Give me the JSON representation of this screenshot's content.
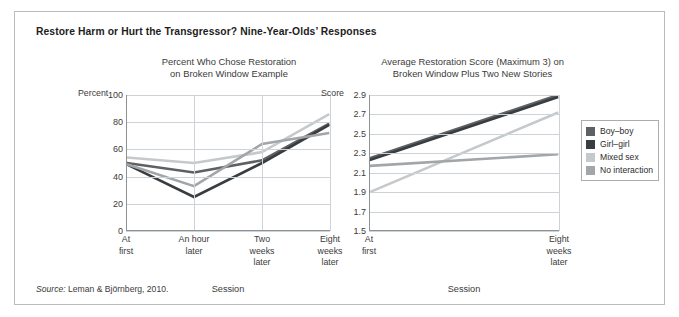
{
  "figure": {
    "title": "Restore Harm or Hurt the Transgressor? Nine-Year-Olds’ Responses",
    "source_prefix": "Source:",
    "source_text": "Leman & Björnberg, 2010.",
    "border_color": "#b9bcbe",
    "background": "#ffffff"
  },
  "legend": {
    "position": "right",
    "items": [
      {
        "label": "Boy–boy",
        "color": "#5e6164"
      },
      {
        "label": "Girl–girl",
        "color": "#3a3d40"
      },
      {
        "label": "Mixed sex",
        "color": "#c6c9cb"
      },
      {
        "label": "No interaction",
        "color": "#a2a6a9"
      }
    ]
  },
  "chart_data": [
    {
      "type": "line",
      "title": "Percent Who Chose Restoration\non Broken Window Example",
      "title_line1": "Percent Who Chose Restoration",
      "title_line2": "on Broken Window Example",
      "ylabel": "Percent",
      "xlabel": "Session",
      "ylim": [
        0,
        100
      ],
      "yticks": [
        100,
        80,
        60,
        40,
        20,
        0
      ],
      "grid": true,
      "categories": [
        "At first",
        "An hour later",
        "Two weeks later",
        "Eight weeks later"
      ],
      "category_lines": [
        [
          "At",
          "first"
        ],
        [
          "An hour",
          "later"
        ],
        [
          "Two",
          "weeks",
          "later"
        ],
        [
          "Eight",
          "weeks",
          "later"
        ]
      ],
      "series": [
        {
          "name": "Boy–boy",
          "color": "#5e6164",
          "values": [
            50,
            43,
            52,
            79
          ]
        },
        {
          "name": "Girl–girl",
          "color": "#3a3d40",
          "values": [
            49,
            25,
            50,
            78
          ]
        },
        {
          "name": "Mixed sex",
          "color": "#c6c9cb",
          "values": [
            54,
            50,
            58,
            86
          ]
        },
        {
          "name": "No interaction",
          "color": "#a2a6a9",
          "values": [
            49,
            33,
            64,
            72
          ]
        }
      ]
    },
    {
      "type": "line",
      "title": "Average Restoration Score (Maximum 3) on\nBroken Window Plus Two New Stories",
      "title_line1": "Average Restoration Score (Maximum 3) on",
      "title_line2": "Broken Window Plus Two New Stories",
      "ylabel": "Score",
      "xlabel": "Session",
      "ylim": [
        1.5,
        2.9
      ],
      "yticks": [
        "2.9",
        "2.7",
        "2.5",
        "2.3",
        "2.1",
        "1.9",
        "1.7",
        "1.5"
      ],
      "grid": true,
      "categories": [
        "At first",
        "Eight weeks later"
      ],
      "category_lines": [
        [
          "At",
          "first"
        ],
        [
          "Eight",
          "weeks",
          "later"
        ]
      ],
      "series": [
        {
          "name": "Boy–boy",
          "color": "#5e6164",
          "values": [
            2.25,
            2.9
          ]
        },
        {
          "name": "Girl–girl",
          "color": "#3a3d40",
          "values": [
            2.23,
            2.88
          ]
        },
        {
          "name": "Mixed sex",
          "color": "#c6c9cb",
          "values": [
            1.9,
            2.72
          ]
        },
        {
          "name": "No interaction",
          "color": "#a2a6a9",
          "values": [
            2.17,
            2.29
          ]
        }
      ]
    }
  ]
}
